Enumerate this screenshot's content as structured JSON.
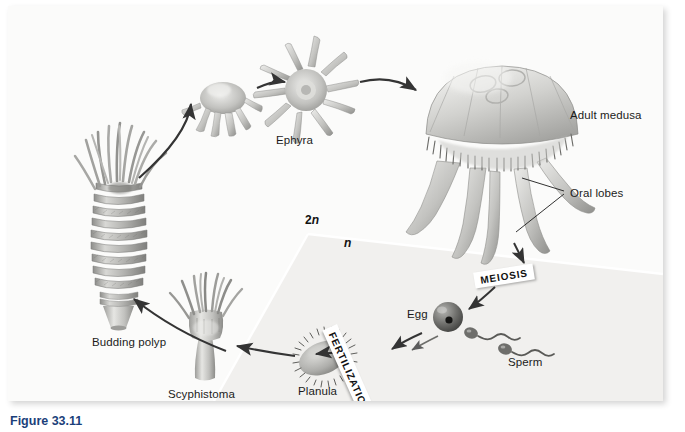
{
  "figure": {
    "caption": "Figure 33.11"
  },
  "panel": {
    "background_color": "#fbfbfa",
    "border_shadow": true
  },
  "ploidy_labels": [
    {
      "id": "diploid",
      "text_main": "2",
      "text_italic": "n",
      "x": 297,
      "y": 214
    },
    {
      "id": "haploid",
      "text_main": "",
      "text_italic": "n",
      "x": 336,
      "y": 237
    }
  ],
  "process_tags": [
    {
      "name": "meiosis",
      "label": "MEIOSIS",
      "rotation_deg": -9
    },
    {
      "name": "fertilization",
      "label": "FERTILIZATION",
      "rotation_deg": 66
    }
  ],
  "stage_labels": [
    {
      "name": "budding-polyp",
      "label": "Budding polyp",
      "x": 84,
      "y": 336
    },
    {
      "name": "scyphistoma",
      "label": "Scyphistoma",
      "x": 183,
      "y": 388
    },
    {
      "name": "planula",
      "label": "Planula",
      "x": 307,
      "y": 385
    },
    {
      "name": "sperm",
      "label": "Sperm",
      "x": 500,
      "y": 356
    },
    {
      "name": "egg",
      "label": "Egg",
      "x": 405,
      "y": 307
    },
    {
      "name": "ephyra",
      "label": "Ephyra",
      "x": 281,
      "y": 134
    },
    {
      "name": "adult-medusa",
      "label": "Adult medusa",
      "x": 568,
      "y": 110
    },
    {
      "name": "oral-lobes",
      "label": "Oral lobes",
      "x": 570,
      "y": 189
    }
  ],
  "colors": {
    "ink": "#1b1b1b",
    "caption": "#1b3f7a",
    "organism_light": "#e8e8e6",
    "organism_mid": "#b9b9b6",
    "organism_dark": "#7d7d7a",
    "arrow": "#3a3a3a",
    "haploid_region": "#f0efed",
    "tag_bg": "#ffffff"
  }
}
